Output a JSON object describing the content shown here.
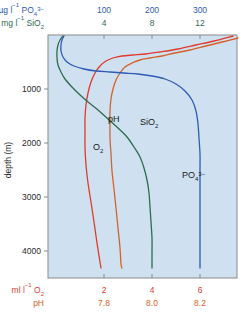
{
  "figure": {
    "background": "#ffffff",
    "plot_background": "#cfe0f0",
    "frame_color": "#8a8a8a"
  },
  "chart_data": {
    "type": "line",
    "title": "",
    "subtitle": "",
    "orientation": "vertical-depth-profile",
    "grid": false,
    "legend": "inline-curve-labels",
    "yaxis": {
      "label": "depth (m)",
      "ticks": [
        1000,
        2000,
        3000,
        4000
      ],
      "tick_labels": [
        "1000",
        "2000",
        "3000",
        "4000"
      ],
      "ylim": [
        0,
        4500
      ],
      "direction": "increasing-downward",
      "color": "#2b2b2b"
    },
    "top_axes": [
      {
        "name": "phosphate",
        "unit_label_parts": {
          "unit": "µg l",
          "exp": "−1",
          "species": "PO",
          "species_sub": "4",
          "species_sup": "3−"
        },
        "unit_label": "µg l⁻¹ PO₄³⁻",
        "ticks": [
          100,
          200,
          300
        ],
        "tick_labels": [
          "100",
          "200",
          "300"
        ],
        "color": "#2f5bb5"
      },
      {
        "name": "silica",
        "unit_label_parts": {
          "unit": "mg l",
          "exp": "−1",
          "species": "SiO",
          "species_sub": "2",
          "species_sup": ""
        },
        "unit_label": "mg l⁻¹ SiO₂",
        "ticks": [
          4,
          8,
          12
        ],
        "tick_labels": [
          "4",
          "8",
          "12"
        ],
        "color": "#2f6b4f"
      }
    ],
    "bottom_axes": [
      {
        "name": "oxygen",
        "unit_label_parts": {
          "unit": "ml l",
          "exp": "−1",
          "species": "O",
          "species_sub": "2",
          "species_sup": ""
        },
        "unit_label": "ml l⁻¹ O₂",
        "ticks": [
          2,
          4,
          6
        ],
        "tick_labels": [
          "2",
          "4",
          "6"
        ],
        "color": "#e03a2f"
      },
      {
        "name": "ph",
        "unit_label_parts": {
          "unit": "pH",
          "exp": "",
          "species": "",
          "species_sub": "",
          "species_sup": ""
        },
        "unit_label": "pH",
        "ticks": [
          7.8,
          8.0,
          8.2
        ],
        "tick_labels": [
          "7.8",
          "8.0",
          "8.2"
        ],
        "color": "#d4622a"
      }
    ],
    "series": [
      {
        "name": "O2",
        "label": "O₂",
        "label_parts": {
          "base": "O",
          "sub": "2",
          "sup": ""
        },
        "color": "#e03a2f",
        "axis": "ml l−1 O2 (bottom)",
        "label_pos": {
          "x": 93,
          "y": 150
        },
        "points_px": [
          [
            233,
            36
          ],
          [
            214,
            41
          ],
          [
            196,
            45
          ],
          [
            178,
            49
          ],
          [
            160,
            52
          ],
          [
            146,
            54
          ],
          [
            133,
            55
          ],
          [
            122,
            56
          ],
          [
            113,
            58
          ],
          [
            106,
            61
          ],
          [
            100,
            66
          ],
          [
            95,
            73
          ],
          [
            91,
            82
          ],
          [
            88,
            93
          ],
          [
            86,
            105
          ],
          [
            85,
            118
          ],
          [
            85,
            132
          ],
          [
            85,
            148
          ],
          [
            86,
            165
          ],
          [
            88,
            183
          ],
          [
            91,
            202
          ],
          [
            94,
            222
          ],
          [
            97,
            243
          ],
          [
            100,
            262
          ],
          [
            101,
            268
          ]
        ]
      },
      {
        "name": "pH",
        "label": "pH",
        "label_parts": {
          "base": "pH",
          "sub": "",
          "sup": ""
        },
        "color": "#d4622a",
        "axis": "pH (bottom)",
        "label_pos": {
          "x": 108,
          "y": 122
        },
        "points_px": [
          [
            238,
            38
          ],
          [
            222,
            42
          ],
          [
            206,
            46
          ],
          [
            190,
            50
          ],
          [
            175,
            53
          ],
          [
            162,
            56
          ],
          [
            150,
            58
          ],
          [
            140,
            60
          ],
          [
            132,
            63
          ],
          [
            125,
            67
          ],
          [
            120,
            73
          ],
          [
            116,
            80
          ],
          [
            113,
            89
          ],
          [
            111,
            99
          ],
          [
            110,
            111
          ],
          [
            110,
            124
          ],
          [
            110,
            138
          ],
          [
            111,
            154
          ],
          [
            112,
            171
          ],
          [
            114,
            189
          ],
          [
            116,
            208
          ],
          [
            118,
            228
          ],
          [
            120,
            248
          ],
          [
            121,
            264
          ],
          [
            122,
            268
          ]
        ]
      },
      {
        "name": "SiO2",
        "label": "SiO₂",
        "label_parts": {
          "base": "SiO",
          "sub": "2",
          "sup": ""
        },
        "color": "#2f6b4f",
        "axis": "mg l−1 SiO2 (top)",
        "label_pos": {
          "x": 140,
          "y": 125
        },
        "points_px": [
          [
            63,
            36
          ],
          [
            60,
            40
          ],
          [
            58,
            45
          ],
          [
            57,
            51
          ],
          [
            57,
            58
          ],
          [
            58,
            65
          ],
          [
            61,
            72
          ],
          [
            65,
            79
          ],
          [
            71,
            86
          ],
          [
            79,
            94
          ],
          [
            88,
            102
          ],
          [
            98,
            110
          ],
          [
            108,
            119
          ],
          [
            118,
            128
          ],
          [
            127,
            137
          ],
          [
            134,
            147
          ],
          [
            140,
            157
          ],
          [
            144,
            168
          ],
          [
            147,
            180
          ],
          [
            149,
            193
          ],
          [
            150,
            207
          ],
          [
            151,
            222
          ],
          [
            152,
            238
          ],
          [
            152,
            254
          ],
          [
            152,
            268
          ]
        ]
      },
      {
        "name": "PO43-",
        "label": "PO₄³⁻",
        "label_parts": {
          "base": "PO",
          "sub": "4",
          "sup": "3−"
        },
        "color": "#2f5bb5",
        "axis": "µg l−1 PO43- (top)",
        "label_pos": {
          "x": 182,
          "y": 178
        },
        "points_px": [
          [
            64,
            36
          ],
          [
            62,
            40
          ],
          [
            61,
            45
          ],
          [
            61,
            51
          ],
          [
            63,
            57
          ],
          [
            67,
            62
          ],
          [
            74,
            66
          ],
          [
            84,
            69
          ],
          [
            96,
            71
          ],
          [
            110,
            72
          ],
          [
            124,
            73
          ],
          [
            138,
            74
          ],
          [
            152,
            76
          ],
          [
            165,
            79
          ],
          [
            176,
            84
          ],
          [
            185,
            91
          ],
          [
            192,
            100
          ],
          [
            196,
            111
          ],
          [
            198,
            124
          ],
          [
            199,
            138
          ],
          [
            200,
            154
          ],
          [
            200,
            171
          ],
          [
            200,
            189
          ],
          [
            200,
            208
          ],
          [
            200,
            228
          ],
          [
            200,
            248
          ],
          [
            200,
            268
          ]
        ]
      }
    ]
  }
}
